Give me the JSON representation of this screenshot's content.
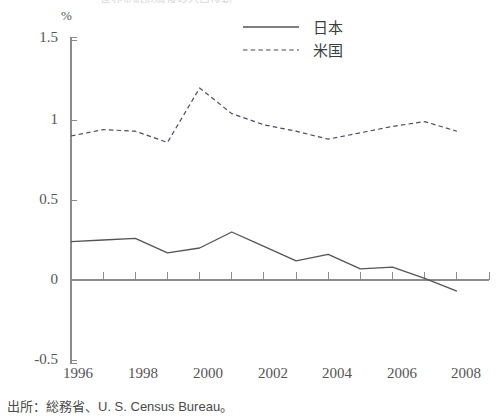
{
  "figure": {
    "clipped_top_text": "世界金融危機後の人口移動",
    "unit_label": "%",
    "source_note": "出所：総務省、U. S. Census Bureau。"
  },
  "legend": {
    "position": "top-center",
    "entries": [
      {
        "label": "日本",
        "style": "solid",
        "key": "japan"
      },
      {
        "label": "米国",
        "style": "dashed",
        "key": "usa"
      }
    ]
  },
  "axes": {
    "y_ticks": [
      "1.5",
      "1",
      "0.5",
      "0",
      "-0.5"
    ],
    "x_ticks": [
      "1996",
      "1998",
      "2000",
      "2002",
      "2004",
      "2006",
      "2008"
    ]
  },
  "chart_data": {
    "type": "line",
    "title": "",
    "subtitle": "",
    "xlabel": "",
    "ylabel": "%",
    "xlim": [
      1996,
      2009
    ],
    "ylim": [
      -0.5,
      1.5
    ],
    "ytick_values": [
      1.5,
      1.0,
      0.5,
      0.0,
      -0.5
    ],
    "xtick_values": [
      1996,
      1998,
      2000,
      2002,
      2004,
      2006,
      2008
    ],
    "x_minor_tick_interval": 1,
    "grid": false,
    "legend_position": "top-center",
    "x": [
      1996,
      1997,
      1998,
      1999,
      2000,
      2001,
      2002,
      2003,
      2004,
      2005,
      2006,
      2007,
      2008
    ],
    "series": [
      {
        "name": "日本",
        "style": "solid",
        "color": "#555555",
        "values": [
          0.24,
          0.25,
          0.26,
          0.17,
          0.2,
          0.3,
          0.21,
          0.12,
          0.16,
          0.07,
          0.08,
          0.01,
          -0.07
        ]
      },
      {
        "name": "米国",
        "style": "dashed",
        "color": "#4b4b63",
        "values": [
          0.9,
          0.94,
          0.93,
          0.86,
          1.2,
          1.04,
          0.97,
          0.93,
          0.88,
          0.92,
          0.96,
          0.99,
          0.93
        ]
      }
    ]
  }
}
